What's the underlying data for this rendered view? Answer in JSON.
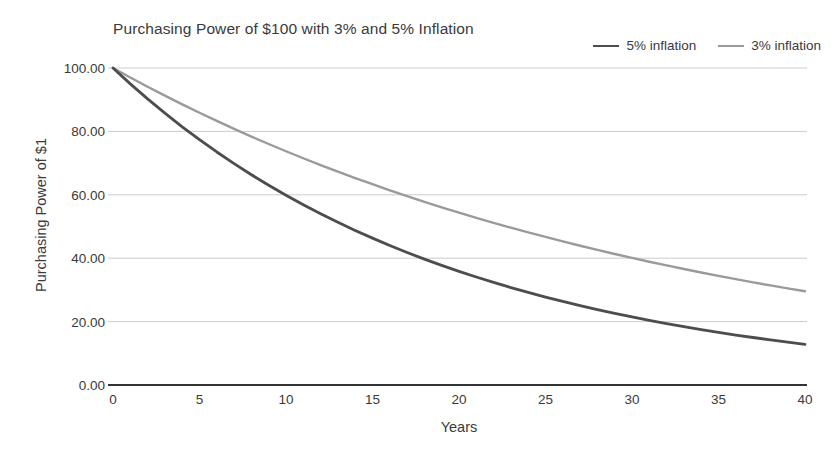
{
  "chart_data": {
    "type": "line",
    "title": "Purchasing Power of $100 with 3% and 5% Inflation",
    "xlabel": "Years",
    "ylabel": "Purchasing Power of $1",
    "xlim": [
      0,
      40
    ],
    "ylim": [
      0,
      100
    ],
    "grid": true,
    "legend_position": "top-right",
    "x_ticks": [
      "0",
      "5",
      "10",
      "15",
      "20",
      "25",
      "30",
      "35",
      "40"
    ],
    "y_ticks": [
      "0.00",
      "20.00",
      "40.00",
      "60.00",
      "80.00",
      "100.00"
    ],
    "x": [
      0,
      1,
      2,
      3,
      4,
      5,
      6,
      7,
      8,
      9,
      10,
      11,
      12,
      13,
      14,
      15,
      16,
      17,
      18,
      19,
      20,
      21,
      22,
      23,
      24,
      25,
      26,
      27,
      28,
      29,
      30,
      31,
      32,
      33,
      34,
      35,
      36,
      37,
      38,
      39,
      40
    ],
    "series": [
      {
        "name": "5% inflation",
        "color": "#4d4d4d",
        "rate": 0.05,
        "values": [
          100.0,
          95.0,
          90.25,
          85.74,
          81.45,
          77.38,
          73.51,
          69.83,
          66.34,
          63.02,
          59.87,
          56.88,
          54.04,
          51.33,
          48.77,
          46.33,
          44.01,
          41.81,
          39.72,
          37.74,
          35.85,
          34.06,
          32.35,
          30.74,
          29.2,
          27.74,
          26.35,
          25.03,
          23.77,
          22.59,
          21.46,
          20.38,
          19.36,
          18.39,
          17.47,
          16.6,
          15.77,
          14.98,
          14.23,
          13.52,
          12.85
        ]
      },
      {
        "name": "3% inflation",
        "color": "#9a9a9a",
        "rate": 0.03,
        "values": [
          100.0,
          97.0,
          94.09,
          91.27,
          88.53,
          85.87,
          83.3,
          80.8,
          78.37,
          76.02,
          73.74,
          71.53,
          69.38,
          67.3,
          65.28,
          63.33,
          61.42,
          59.58,
          57.8,
          56.06,
          54.38,
          52.75,
          51.17,
          49.63,
          48.14,
          46.7,
          45.29,
          43.93,
          42.61,
          41.33,
          40.1,
          38.89,
          37.72,
          36.59,
          35.49,
          34.42,
          33.39,
          32.38,
          31.41,
          30.47,
          29.56
        ]
      }
    ]
  },
  "legend": {
    "entries": [
      {
        "label": "5% inflation"
      },
      {
        "label": "3% inflation"
      }
    ]
  },
  "colors": {
    "series_5pct": "#4d4d4d",
    "series_3pct": "#9a9a9a",
    "grid": "#cccccc",
    "axis": "#333333",
    "text": "#3a3a3a",
    "background": "#ffffff"
  }
}
